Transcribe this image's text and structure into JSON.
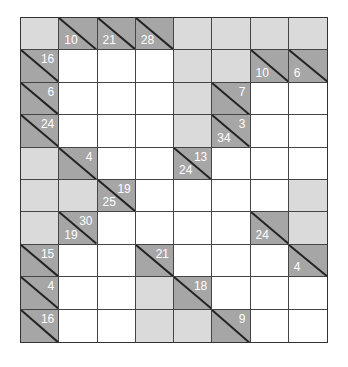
{
  "puzzle": {
    "type": "kakuro",
    "columns": 8,
    "rows": 10,
    "colors": {
      "white": "#ffffff",
      "blank": "#dadada",
      "clue": "#a6a6a6",
      "clue_text": "#ffffff",
      "grid_line": "#444444"
    },
    "grid": [
      [
        {
          "t": "blank"
        },
        {
          "t": "clue",
          "down": "10"
        },
        {
          "t": "clue",
          "down": "21"
        },
        {
          "t": "clue",
          "down": "28"
        },
        {
          "t": "blank"
        },
        {
          "t": "blank"
        },
        {
          "t": "blank"
        },
        {
          "t": "blank"
        }
      ],
      [
        {
          "t": "clue",
          "right": "16"
        },
        {
          "t": "white"
        },
        {
          "t": "white"
        },
        {
          "t": "white"
        },
        {
          "t": "blank"
        },
        {
          "t": "blank"
        },
        {
          "t": "clue",
          "down": "10"
        },
        {
          "t": "clue",
          "down": "6"
        }
      ],
      [
        {
          "t": "clue",
          "right": "6"
        },
        {
          "t": "white"
        },
        {
          "t": "white"
        },
        {
          "t": "white"
        },
        {
          "t": "blank"
        },
        {
          "t": "clue",
          "right": "7"
        },
        {
          "t": "white"
        },
        {
          "t": "white"
        }
      ],
      [
        {
          "t": "clue",
          "right": "24"
        },
        {
          "t": "white"
        },
        {
          "t": "white"
        },
        {
          "t": "white"
        },
        {
          "t": "blank"
        },
        {
          "t": "clue",
          "down": "34",
          "right": "3"
        },
        {
          "t": "white"
        },
        {
          "t": "white"
        }
      ],
      [
        {
          "t": "blank"
        },
        {
          "t": "clue",
          "right": "4"
        },
        {
          "t": "white"
        },
        {
          "t": "white"
        },
        {
          "t": "clue",
          "down": "24",
          "right": "13"
        },
        {
          "t": "white"
        },
        {
          "t": "white"
        },
        {
          "t": "white"
        }
      ],
      [
        {
          "t": "blank"
        },
        {
          "t": "blank"
        },
        {
          "t": "clue",
          "down": "25",
          "right": "19"
        },
        {
          "t": "white"
        },
        {
          "t": "white"
        },
        {
          "t": "white"
        },
        {
          "t": "white"
        },
        {
          "t": "blank"
        }
      ],
      [
        {
          "t": "blank"
        },
        {
          "t": "clue",
          "down": "19",
          "right": "30"
        },
        {
          "t": "white"
        },
        {
          "t": "white"
        },
        {
          "t": "white"
        },
        {
          "t": "white"
        },
        {
          "t": "clue",
          "down": "24"
        },
        {
          "t": "blank"
        }
      ],
      [
        {
          "t": "clue",
          "right": "15"
        },
        {
          "t": "white"
        },
        {
          "t": "white"
        },
        {
          "t": "clue",
          "right": "21"
        },
        {
          "t": "white"
        },
        {
          "t": "white"
        },
        {
          "t": "white"
        },
        {
          "t": "clue",
          "down": "4"
        }
      ],
      [
        {
          "t": "clue",
          "right": "4"
        },
        {
          "t": "white"
        },
        {
          "t": "white"
        },
        {
          "t": "blank"
        },
        {
          "t": "clue",
          "right": "18"
        },
        {
          "t": "white"
        },
        {
          "t": "white"
        },
        {
          "t": "white"
        }
      ],
      [
        {
          "t": "clue",
          "right": "16"
        },
        {
          "t": "white"
        },
        {
          "t": "white"
        },
        {
          "t": "blank"
        },
        {
          "t": "blank"
        },
        {
          "t": "clue",
          "right": "9"
        },
        {
          "t": "white"
        },
        {
          "t": "white"
        }
      ]
    ]
  }
}
